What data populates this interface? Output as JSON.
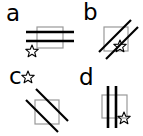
{
  "figure": {
    "width": 143,
    "height": 136,
    "background": "#ffffff"
  },
  "colors": {
    "stroke": "#000000",
    "square_outline": "#999999",
    "background": "#ffffff"
  },
  "panels": [
    {
      "id": "a",
      "label": "a",
      "square": {
        "x": 10,
        "y": 4,
        "width": 26,
        "height": 20
      },
      "bars": {
        "orientation": "horizontal",
        "count": 2,
        "angle_deg": 0
      },
      "star": {
        "position": "below-left",
        "points": 5,
        "filled": false
      }
    },
    {
      "id": "b",
      "label": "b",
      "square": {
        "x": 5,
        "y": 5,
        "width": 24,
        "height": 24
      },
      "bars": {
        "orientation": "diagonal-up",
        "count": 2,
        "angle_deg": -45
      },
      "star": {
        "position": "below-right",
        "points": 5,
        "filled": false
      }
    },
    {
      "id": "c",
      "label": "c",
      "square": {
        "x": 12,
        "y": 10,
        "width": 24,
        "height": 24
      },
      "bars": {
        "orientation": "diagonal-down",
        "count": 2,
        "angle_deg": 45
      },
      "star": {
        "position": "above-left",
        "points": 5,
        "filled": false
      }
    },
    {
      "id": "d",
      "label": "d",
      "square": {
        "x": 8,
        "y": 6,
        "width": 24,
        "height": 24
      },
      "bars": {
        "orientation": "vertical",
        "count": 2,
        "angle_deg": 90
      },
      "star": {
        "position": "below-right",
        "points": 5,
        "filled": false
      }
    }
  ]
}
